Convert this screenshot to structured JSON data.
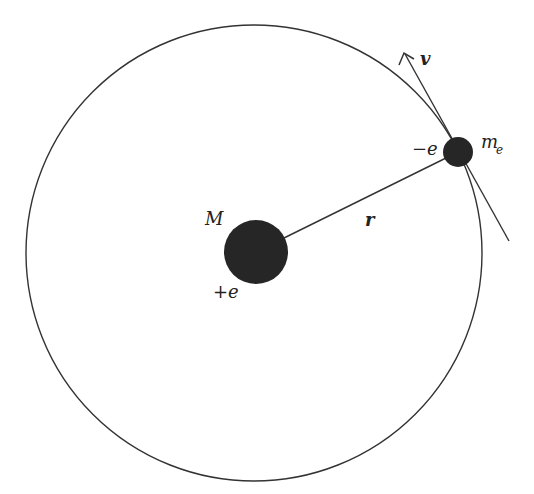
{
  "diagram": {
    "type": "bohr-atom-orbit",
    "colors": {
      "stroke": "#333333",
      "fill": "#262626",
      "text": "#222222",
      "background": "#ffffff"
    },
    "orbit": {
      "cx": 254,
      "cy": 253,
      "r": 228
    },
    "nucleus": {
      "cx": 256,
      "cy": 252,
      "r": 32,
      "mass_label": "M",
      "charge_label": "+e"
    },
    "electron": {
      "cx": 458,
      "cy": 152,
      "r": 15,
      "mass_label": "m",
      "mass_subscript": "e",
      "charge_label": "−e"
    },
    "radius_vector": {
      "label": "r"
    },
    "velocity": {
      "label": "v"
    }
  }
}
